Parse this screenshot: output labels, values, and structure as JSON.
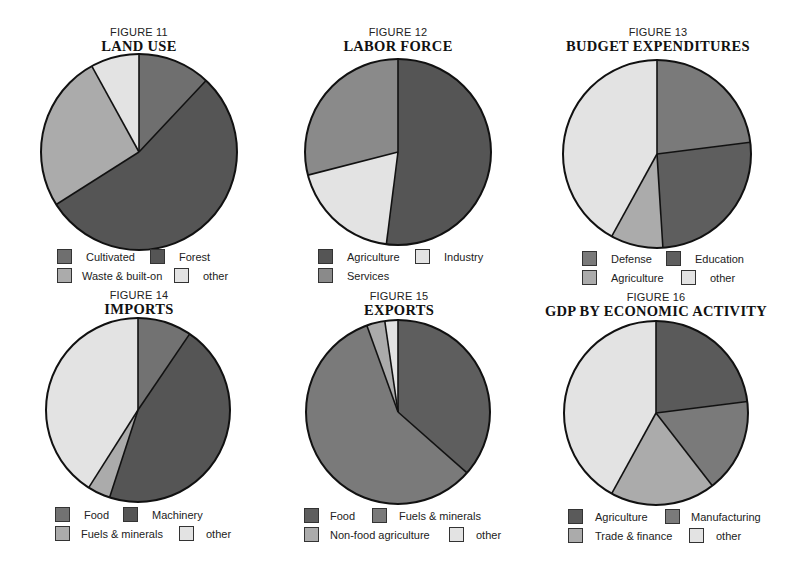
{
  "colors": {
    "darkest": "#555555",
    "dark": "#6f6f6f",
    "medium": "#8a8a8a",
    "light": "#ababab",
    "lightest": "#e3e3e3",
    "outline": "#111111"
  },
  "figures": [
    {
      "number": "FIGURE 11",
      "title": "LAND USE",
      "legend": [
        "Cultivated",
        "Forest",
        "Waste & built-on",
        "other"
      ]
    },
    {
      "number": "FIGURE 12",
      "title": "LABOR FORCE",
      "legend": [
        "Agriculture",
        "Industry",
        "Services"
      ]
    },
    {
      "number": "FIGURE 13",
      "title": "BUDGET EXPENDITURES",
      "legend": [
        "Defense",
        "Education",
        "Agriculture",
        "other"
      ]
    },
    {
      "number": "FIGURE 14",
      "title": "IMPORTS",
      "legend": [
        "Food",
        "Machinery",
        "Fuels & minerals",
        "other"
      ]
    },
    {
      "number": "FIGURE 15",
      "title": "EXPORTS",
      "legend": [
        "Food",
        "Fuels & minerals",
        "Non-food agriculture",
        "other"
      ]
    },
    {
      "number": "FIGURE 16",
      "title": "GDP BY ECONOMIC ACTIVITY",
      "legend": [
        "Agriculture",
        "Manufacturing",
        "Trade & finance",
        "other"
      ]
    }
  ],
  "chart_data": [
    {
      "type": "pie",
      "title": "FIGURE 11 LAND USE",
      "categories": [
        "Cultivated",
        "Forest",
        "Waste & built-on",
        "other"
      ],
      "values": [
        12,
        54,
        26,
        8
      ],
      "colors": [
        "#6f6f6f",
        "#555555",
        "#ababab",
        "#e3e3e3"
      ],
      "legend_position": "bottom"
    },
    {
      "type": "pie",
      "title": "FIGURE 12 LABOR FORCE",
      "categories": [
        "Agriculture",
        "Industry",
        "Services"
      ],
      "values": [
        52,
        19,
        29
      ],
      "colors": [
        "#555555",
        "#e3e3e3",
        "#8a8a8a"
      ],
      "legend_position": "bottom"
    },
    {
      "type": "pie",
      "title": "FIGURE 13 BUDGET EXPENDITURES",
      "categories": [
        "Defense",
        "Education",
        "Agriculture",
        "other"
      ],
      "values": [
        23,
        26,
        9,
        42
      ],
      "colors": [
        "#7a7a7a",
        "#5e5e5e",
        "#ababab",
        "#e3e3e3"
      ],
      "legend_position": "bottom"
    },
    {
      "type": "pie",
      "title": "FIGURE 14 IMPORTS",
      "categories": [
        "Food",
        "Machinery",
        "Fuels & minerals",
        "other"
      ],
      "values": [
        9.5,
        45.5,
        4,
        41
      ],
      "colors": [
        "#727272",
        "#555555",
        "#ababab",
        "#e3e3e3"
      ],
      "legend_position": "bottom"
    },
    {
      "type": "pie",
      "title": "FIGURE 15 EXPORTS",
      "categories": [
        "Food",
        "Fuels & minerals",
        "Non-food agriculture",
        "other"
      ],
      "values": [
        36.5,
        58,
        3.2,
        2.3
      ],
      "colors": [
        "#5e5e5e",
        "#7a7a7a",
        "#ababab",
        "#e3e3e3"
      ],
      "legend_position": "bottom"
    },
    {
      "type": "pie",
      "title": "FIGURE 16 GDP BY ECONOMIC ACTIVITY",
      "categories": [
        "Agriculture",
        "Manufacturing",
        "Trade & finance",
        "other"
      ],
      "values": [
        23,
        16.5,
        18.5,
        42
      ],
      "colors": [
        "#5a5a5a",
        "#7a7a7a",
        "#ababab",
        "#e3e3e3"
      ],
      "legend_position": "bottom"
    }
  ]
}
